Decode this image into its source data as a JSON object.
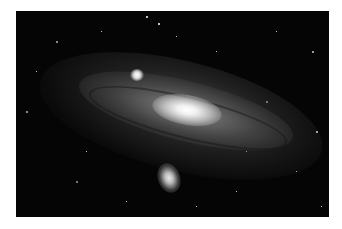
{
  "image": {
    "subject": "Andromeda galaxy",
    "description": "Spiral galaxy with bright core, dust lanes, and two satellite galaxies against a star field",
    "colors": {
      "background": "#ffffff",
      "sky": "#050505",
      "core": "#ffffff"
    }
  }
}
